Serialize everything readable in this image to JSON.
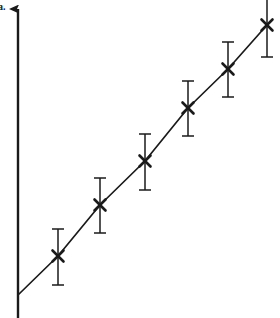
{
  "figure": {
    "panel_label": "a.",
    "background_color": "#ffffff",
    "ink_color": "#1a1a1a",
    "width": 280,
    "height": 318
  },
  "axis": {
    "y_axis_name": "y-axis",
    "has_arrowhead": true,
    "arrow_direction": "up",
    "x_position": 18,
    "top": 8,
    "bottom": 318,
    "x_axis_drawn": false
  },
  "chart_data": {
    "type": "scatter",
    "title": "",
    "subtitle": "",
    "xlabel": "",
    "ylabel": "",
    "grid": false,
    "legend": "none",
    "marker": "x-cross",
    "has_error_bars": true,
    "error_bar_direction": "vertical",
    "connected_by_line": true,
    "line_style": "solid",
    "line_origin": {
      "x": 18,
      "y": 295
    },
    "xlim": [
      0,
      280
    ],
    "ylim": [
      0,
      318
    ],
    "axis_tick_labels": {
      "x": [],
      "y": []
    },
    "x": [
      58,
      100,
      145,
      188,
      228,
      267
    ],
    "y": [
      256,
      205,
      161,
      108,
      69,
      25
    ],
    "y_err_low": [
      285,
      233,
      190,
      136,
      97,
      57
    ],
    "y_err_high": [
      229,
      178,
      134,
      81,
      42,
      -7
    ],
    "points": [
      {
        "index": 1,
        "x": 58,
        "y": 256,
        "err_top": 229,
        "err_bottom": 285,
        "err_half": 28,
        "clipped": false
      },
      {
        "index": 2,
        "x": 100,
        "y": 205,
        "err_top": 178,
        "err_bottom": 233,
        "err_half": 28,
        "clipped": false
      },
      {
        "index": 3,
        "x": 145,
        "y": 161,
        "err_top": 134,
        "err_bottom": 190,
        "err_half": 28,
        "clipped": false
      },
      {
        "index": 4,
        "x": 188,
        "y": 108,
        "err_top": 81,
        "err_bottom": 136,
        "err_half": 28,
        "clipped": false
      },
      {
        "index": 5,
        "x": 228,
        "y": 69,
        "err_top": 42,
        "err_bottom": 97,
        "err_half": 28,
        "clipped": false
      },
      {
        "index": 6,
        "x": 267,
        "y": 25,
        "err_top": -7,
        "err_bottom": 57,
        "err_half": 28,
        "clipped": true
      }
    ],
    "cap_width": 12,
    "marker_size": 11,
    "annotations": []
  }
}
